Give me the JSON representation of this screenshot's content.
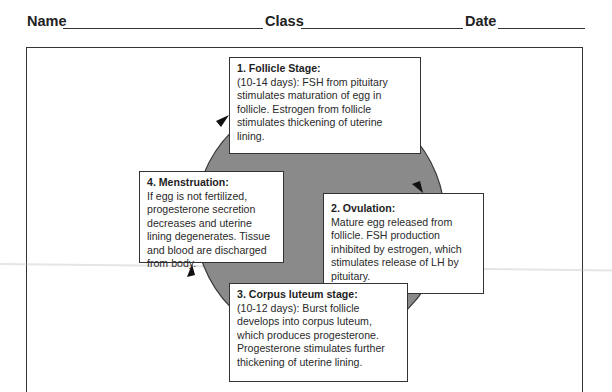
{
  "header": {
    "name_label": "Name",
    "class_label": "Class",
    "date_label": "Date"
  },
  "colors": {
    "cycle_fill": "#8a8a8a",
    "border": "#333333"
  },
  "cycle": {
    "stages": [
      {
        "title": "1. Follicle Stage:",
        "body": "(10-14 days):  FSH from pituitary stimulates maturation of egg in follicle.  Estrogen from follicle stimulates thickening of uterine lining."
      },
      {
        "title": "2.  Ovulation:",
        "body": "Mature egg released from follicle. FSH  production inhibited by estrogen, which stimulates release of LH by pituitary."
      },
      {
        "title": "3. Corpus luteum stage:",
        "body": "(10-12 days):  Burst follicle develops into corpus luteum, which produces progesterone. Progesterone stimulates further thickening of uterine lining."
      },
      {
        "title": "4.  Menstruation:",
        "body": "If egg is not fertilized, progesterone secretion decreases and uterine lining degenerates.  Tissue and blood are discharged from body."
      }
    ]
  }
}
